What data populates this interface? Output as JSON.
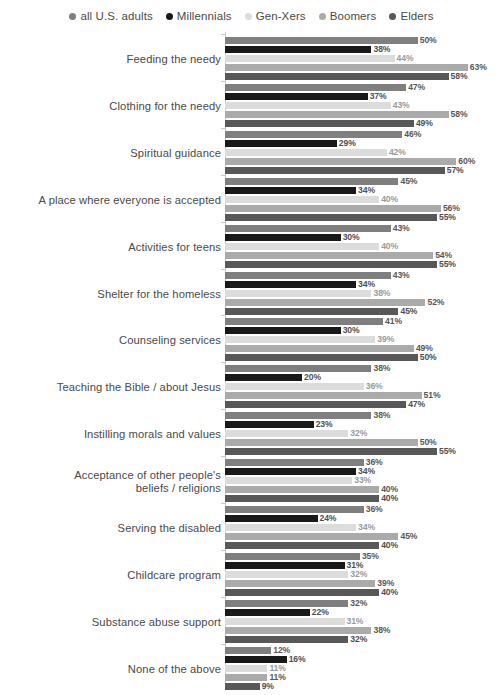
{
  "legend": {
    "position": "top-center",
    "items": [
      {
        "label": "all U.S. adults",
        "color": "#7f7f7f"
      },
      {
        "label": "Millennials",
        "color": "#191919"
      },
      {
        "label": "Gen-Xers",
        "color": "#dcdcdc"
      },
      {
        "label": "Boomers",
        "color": "#aaaaaa"
      },
      {
        "label": "Elders",
        "color": "#585858"
      }
    ]
  },
  "chart_data": {
    "type": "bar",
    "orientation": "horizontal",
    "title": "",
    "subtitle": "",
    "xlabel": "",
    "ylabel": "",
    "xlim": [
      0,
      63
    ],
    "grid": false,
    "value_suffix": "%",
    "legend_position": "top-center",
    "series": [
      {
        "name": "all U.S. adults",
        "color": "#7f7f7f",
        "values": [
          50,
          47,
          46,
          45,
          43,
          43,
          41,
          38,
          38,
          36,
          36,
          35,
          32,
          12
        ]
      },
      {
        "name": "Millennials",
        "color": "#191919",
        "values": [
          38,
          37,
          29,
          34,
          30,
          34,
          30,
          20,
          23,
          34,
          24,
          31,
          22,
          16
        ]
      },
      {
        "name": "Gen-Xers",
        "color": "#dcdcdc",
        "values": [
          44,
          43,
          42,
          40,
          40,
          38,
          39,
          36,
          32,
          33,
          34,
          32,
          31,
          11
        ]
      },
      {
        "name": "Boomers",
        "color": "#aaaaaa",
        "values": [
          63,
          58,
          60,
          56,
          54,
          52,
          49,
          51,
          50,
          40,
          45,
          39,
          38,
          11
        ]
      },
      {
        "name": "Elders",
        "color": "#585858",
        "values": [
          58,
          49,
          57,
          55,
          55,
          45,
          50,
          47,
          55,
          40,
          40,
          40,
          32,
          9
        ]
      }
    ],
    "categories": [
      "Feeding the needy",
      "Clothing for the needy",
      "Spiritual guidance",
      "A place where everyone is accepted",
      "Activities for teens",
      "Shelter for the homeless",
      "Counseling services",
      "Teaching the Bible / about Jesus",
      "Instilling morals and values",
      "Acceptance of other people's\nbeliefs / religions",
      "Serving the disabled",
      "Childcare program",
      "Substance abuse support",
      "None of the above"
    ],
    "labels": {
      "Feeding the needy": [
        "50%",
        "38%",
        "44%",
        "63%",
        "58%"
      ],
      "Clothing for the needy": [
        "47%",
        "37%",
        "43%",
        "58%",
        "49%"
      ],
      "Spiritual guidance": [
        "46%",
        "29%",
        "42%",
        "60%",
        "57%"
      ],
      "A place where everyone is accepted": [
        "45%",
        "34%",
        "40%",
        "56%",
        "55%"
      ],
      "Activities for teens": [
        "43%",
        "30%",
        "40%",
        "54%",
        "55%"
      ],
      "Shelter for the homeless": [
        "43%",
        "34%",
        "38%",
        "52%",
        "45%"
      ],
      "Counseling services": [
        "41%",
        "30%",
        "39%",
        "49%",
        "50%"
      ],
      "Teaching the Bible / about Jesus": [
        "38%",
        "20%",
        "36%",
        "51%",
        "47%"
      ],
      "Instilling morals and values": [
        "38%",
        "23%",
        "32%",
        "50%",
        "55%"
      ],
      "Acceptance of other people's beliefs / religions": [
        "36%",
        "34%",
        "33%",
        "40%",
        "40%"
      ],
      "Serving the disabled": [
        "36%",
        "24%",
        "34%",
        "45%",
        "40%"
      ],
      "Childcare program": [
        "35%",
        "31%",
        "32%",
        "39%",
        "40%"
      ],
      "Substance abuse support": [
        "32%",
        "22%",
        "31%",
        "38%",
        "32%"
      ],
      "None of the above": [
        "12%",
        "16%",
        "11%",
        "11%",
        "9%"
      ]
    }
  }
}
